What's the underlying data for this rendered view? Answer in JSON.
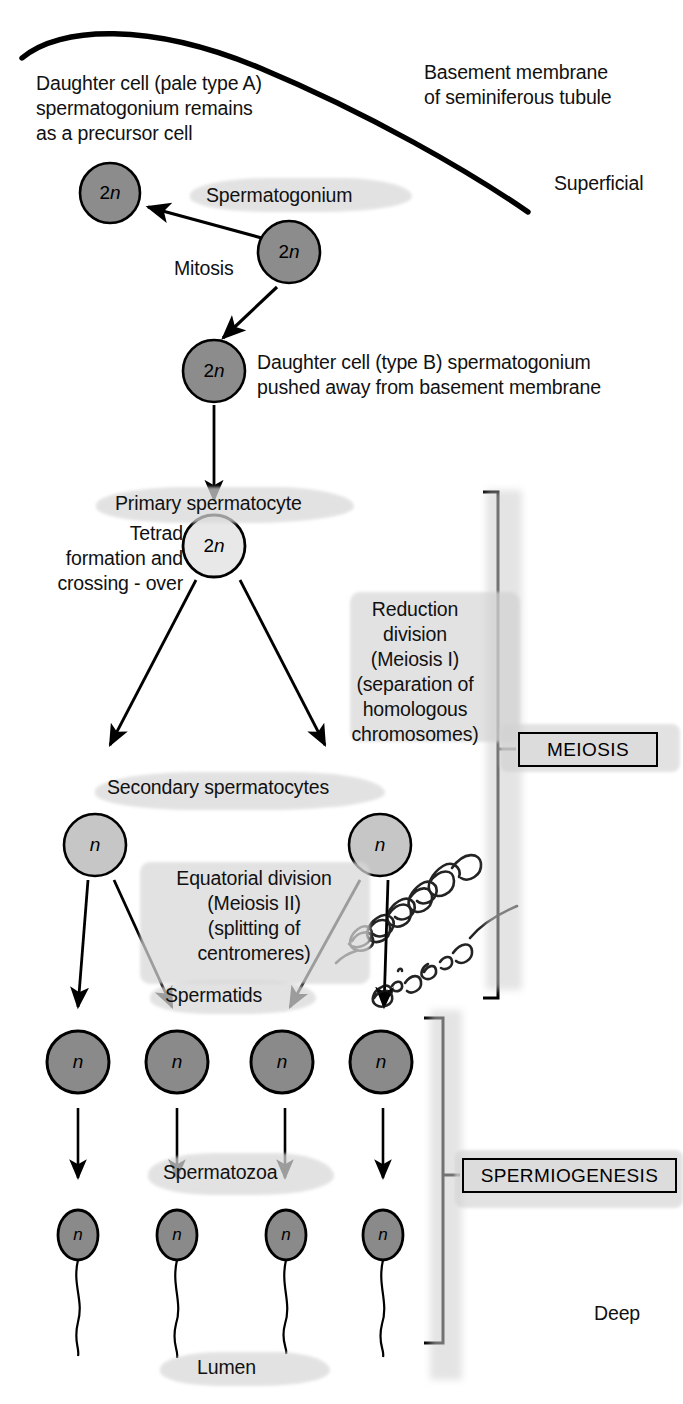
{
  "diagram": {
    "colors": {
      "cell_dark": "#8c8c8c",
      "cell_mid": "#b8b8b8",
      "cell_pale": "#e8e8e8",
      "outline": "#000000",
      "highlighter": "#d8d8d8",
      "box_fill": "#dcdcdc"
    }
  },
  "annotations": {
    "basement_membrane": "Basement membrane\nof seminiferous tubule",
    "superficial": "Superficial",
    "deep": "Deep",
    "daughter_a": "Daughter cell (pale type A)\nspermatogonium remains\nas a precursor cell",
    "mitosis": "Mitosis",
    "daughter_b": "Daughter cell (type B) spermatogonium\npushed away from basement membrane",
    "tetrad": "Tetrad\nformation and\ncrossing - over",
    "reduction_division": "Reduction\ndivision\n(Meiosis I)\n(separation of\nhomologous\nchromosomes)",
    "equatorial_division": "Equatorial division\n(Meiosis II)\n(splitting of\ncentromeres)",
    "handwritten_note": "effectional division"
  },
  "stage_labels": {
    "spermatogonium": "Spermatogonium",
    "primary_spermatocyte": "Primary spermatocyte",
    "secondary_spermatocytes": "Secondary spermatocytes",
    "spermatids": "Spermatids",
    "spermatozoa": "Spermatozoa",
    "lumen": "Lumen"
  },
  "bracket_labels": {
    "meiosis": "MEIOSIS",
    "spermiogenesis": "SPERMIOGENESIS"
  },
  "cells": {
    "ploidy_diploid": "2n",
    "ploidy_haploid": "n",
    "daughter_type_a": {
      "label": "2n",
      "cx": 110,
      "cy": 193,
      "r": 30,
      "fill": "cell_dark"
    },
    "spermatogonium": {
      "label": "2n",
      "cx": 289,
      "cy": 252,
      "r": 31,
      "fill": "cell_dark"
    },
    "daughter_type_b": {
      "label": "2n",
      "cx": 214,
      "cy": 371,
      "r": 31,
      "fill": "cell_dark"
    },
    "primary_spermatocyte": {
      "label": "2n",
      "cx": 214,
      "cy": 546,
      "r": 31,
      "fill": "cell_pale"
    },
    "secondary_spermatocytes": [
      {
        "label": "n",
        "cx": 95,
        "cy": 845,
        "r": 31,
        "fill": "cell_mid"
      },
      {
        "label": "n",
        "cx": 380,
        "cy": 845,
        "r": 31,
        "fill": "cell_mid"
      }
    ],
    "spermatids": [
      {
        "label": "n",
        "cx": 78,
        "cy": 1062,
        "r": 31,
        "fill": "cell_dark"
      },
      {
        "label": "n",
        "cx": 177,
        "cy": 1062,
        "r": 31,
        "fill": "cell_dark"
      },
      {
        "label": "n",
        "cx": 282,
        "cy": 1062,
        "r": 31,
        "fill": "cell_dark"
      },
      {
        "label": "n",
        "cx": 381,
        "cy": 1062,
        "r": 31,
        "fill": "cell_dark"
      }
    ],
    "spermatozoa": [
      {
        "label": "n",
        "cx": 78,
        "cy": 1235,
        "rx": 20,
        "ry": 25,
        "fill": "cell_dark"
      },
      {
        "label": "n",
        "cx": 177,
        "cy": 1235,
        "rx": 20,
        "ry": 25,
        "fill": "cell_dark"
      },
      {
        "label": "n",
        "cx": 286,
        "cy": 1235,
        "rx": 20,
        "ry": 25,
        "fill": "cell_dark"
      },
      {
        "label": "n",
        "cx": 383,
        "cy": 1235,
        "rx": 20,
        "ry": 25,
        "fill": "cell_dark"
      }
    ]
  }
}
